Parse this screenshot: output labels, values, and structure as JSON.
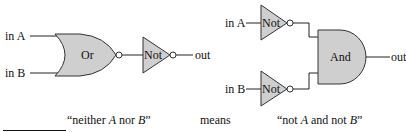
{
  "left_circuit": {
    "input_a": "in A",
    "input_b": "in B",
    "gate1_label": "Or",
    "gate2_label": "Not",
    "output": "out"
  },
  "right_circuit": {
    "input_a": "in A",
    "input_b": "in B",
    "not_a_label": "Not",
    "not_b_label": "Not",
    "and_label": "And",
    "output": "out"
  },
  "captions": {
    "left_prefix": "“neither ",
    "left_a": "A",
    "left_mid": " nor ",
    "left_b": "B",
    "left_suffix": "”",
    "middle": "means",
    "right_prefix": "“not ",
    "right_a": "A",
    "right_mid": " and not ",
    "right_b": "B",
    "right_suffix": "”"
  },
  "colors": {
    "gate_fill": "#cfcfcf",
    "stroke": "#333333"
  }
}
